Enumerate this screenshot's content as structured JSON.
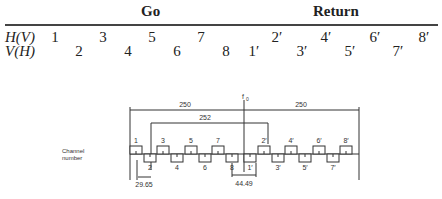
{
  "table": {
    "headers": [
      {
        "label": "Go",
        "x": 150
      },
      {
        "label": "Return",
        "x": 334
      }
    ],
    "rows": [
      {
        "label": "H(V)",
        "y": 29,
        "cells": [
          {
            "v": "1",
            "x": 55
          },
          {
            "v": "3",
            "x": 103
          },
          {
            "v": "5",
            "x": 152
          },
          {
            "v": "7",
            "x": 201
          },
          {
            "v": "2′",
            "x": 277
          },
          {
            "v": "4′",
            "x": 326
          },
          {
            "v": "6′",
            "x": 375
          },
          {
            "v": "8′",
            "x": 424
          }
        ]
      },
      {
        "label": "V(H)",
        "y": 43,
        "cells": [
          {
            "v": "2",
            "x": 79
          },
          {
            "v": "4",
            "x": 128
          },
          {
            "v": "6",
            "x": 177
          },
          {
            "v": "8",
            "x": 226
          },
          {
            "v": "1′",
            "x": 254
          },
          {
            "v": "3′",
            "x": 302
          },
          {
            "v": "5′",
            "x": 350
          },
          {
            "v": "7′",
            "x": 398
          }
        ]
      }
    ]
  },
  "diagram": {
    "axis_label_line1": "Channel",
    "axis_label_line2": "number",
    "center_label": "f",
    "center_subscript": "0",
    "dim_left": "250",
    "dim_right": "250",
    "dim_span": "252",
    "dim_spacing": "29.65",
    "dim_center_gap": "44.49",
    "channels_upper": [
      {
        "label": "1",
        "x": 136
      },
      {
        "label": "3",
        "x": 163
      },
      {
        "label": "5",
        "x": 191
      },
      {
        "label": "7",
        "x": 218
      },
      {
        "label": "2′",
        "x": 264
      },
      {
        "label": "4′",
        "x": 291
      },
      {
        "label": "6′",
        "x": 319
      },
      {
        "label": "8′",
        "x": 346
      }
    ],
    "channels_lower": [
      {
        "label": "2",
        "x": 150
      },
      {
        "label": "4",
        "x": 177
      },
      {
        "label": "6",
        "x": 205
      },
      {
        "label": "8",
        "x": 232
      },
      {
        "label": "1′",
        "x": 250
      },
      {
        "label": "3′",
        "x": 278
      },
      {
        "label": "5′",
        "x": 305
      },
      {
        "label": "7′",
        "x": 333
      }
    ]
  }
}
